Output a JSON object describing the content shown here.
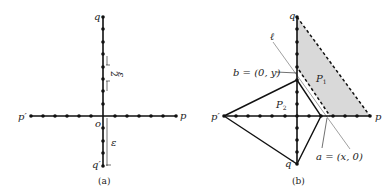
{
  "figure_a": {
    "caption": "(a)",
    "labels": {
      "q": "q",
      "q_prime": "q′",
      "p": "p",
      "p_prime": "p′",
      "origin": "o",
      "epsilon": "ε",
      "eps_half_num": "ε",
      "eps_half_den": "2"
    },
    "colors": {
      "line": "#111111",
      "dot": "#111111"
    }
  },
  "figure_b": {
    "caption": "(b)",
    "labels": {
      "q": "q",
      "q_prime": "q′",
      "p": "p",
      "p_prime": "p′",
      "ell": "ℓ",
      "b_point": "b = (0, y)",
      "a_point": "a = (x, 0)",
      "P1": "P",
      "P1_sub": "1",
      "P2": "P",
      "P2_sub": "2"
    },
    "colors": {
      "shade": "#d9d9d9",
      "line": "#111111",
      "ell_line": "#888888"
    }
  }
}
